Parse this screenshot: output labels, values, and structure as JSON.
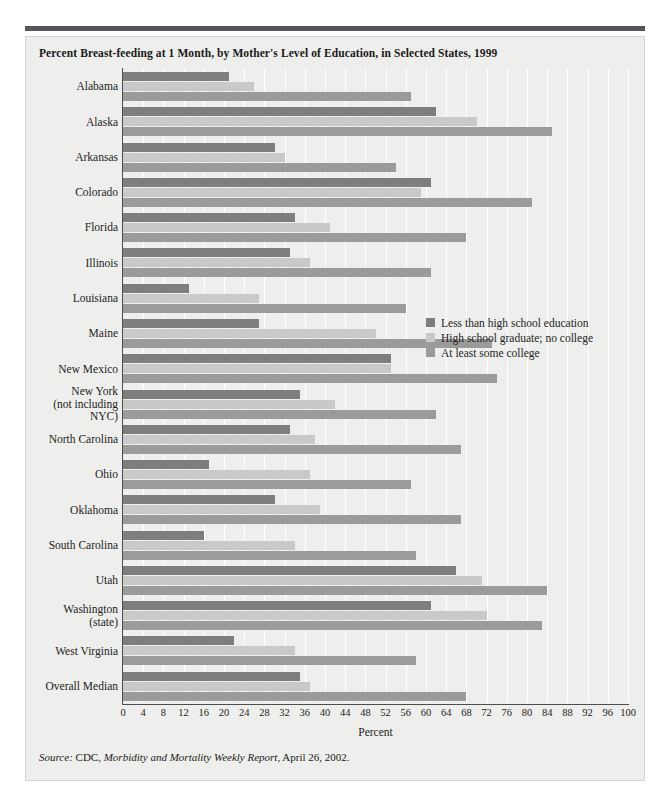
{
  "figure": {
    "title": "Percent Breast-feeding at 1 Month, by Mother's Level of Education, in Selected States, 1999",
    "source_prefix": "Source:",
    "source_rest_a": " CDC, ",
    "source_italic": "Morbidity and Mortality Weekly Report",
    "source_rest_b": ", April 26, 2002.",
    "colors": {
      "series_less_than_hs": "#7e7e7e",
      "series_hs_grad": "#c9c9c7",
      "series_some_college": "#9b9b99",
      "panel_background": "#eeeeec",
      "top_rule": "#55565a",
      "axis": "#4d4d4d",
      "gridline": "#ffffff",
      "text": "#1d1d1d"
    }
  },
  "chart_data": {
    "type": "bar",
    "orientation": "horizontal",
    "title": "Percent Breast-feeding at 1 Month, by Mother's Level of Education, in Selected States, 1999",
    "xlabel": "Percent",
    "ylabel": "",
    "xlim": [
      0,
      100
    ],
    "xticks": [
      0,
      4,
      8,
      12,
      16,
      20,
      24,
      28,
      32,
      36,
      40,
      44,
      48,
      52,
      56,
      60,
      64,
      68,
      72,
      76,
      80,
      84,
      88,
      92,
      96,
      100
    ],
    "grid": "vertical",
    "legend_position": "inside-right",
    "categories": [
      "Alabama",
      "Alaska",
      "Arkansas",
      "Colorado",
      "Florida",
      "Illinois",
      "Louisiana",
      "Maine",
      "New Mexico",
      "New York\n(not including\nNYC)",
      "North Carolina",
      "Ohio",
      "Oklahoma",
      "South Carolina",
      "Utah",
      "Washington\n(state)",
      "West Virginia",
      "Overall Median"
    ],
    "series": [
      {
        "name": "Less than high school education",
        "color": "#7e7e7e",
        "values": [
          21,
          62,
          30,
          61,
          34,
          33,
          13,
          27,
          53,
          35,
          33,
          17,
          30,
          16,
          66,
          61,
          22,
          35
        ]
      },
      {
        "name": "High school graduate; no college",
        "color": "#c9c9c7",
        "values": [
          26,
          70,
          32,
          59,
          41,
          37,
          27,
          50,
          53,
          42,
          38,
          37,
          39,
          34,
          71,
          72,
          34,
          37
        ]
      },
      {
        "name": "At least some college",
        "color": "#9b9b99",
        "values": [
          57,
          85,
          54,
          81,
          68,
          61,
          56,
          73,
          74,
          62,
          67,
          57,
          67,
          58,
          84,
          83,
          58,
          68
        ]
      }
    ]
  }
}
